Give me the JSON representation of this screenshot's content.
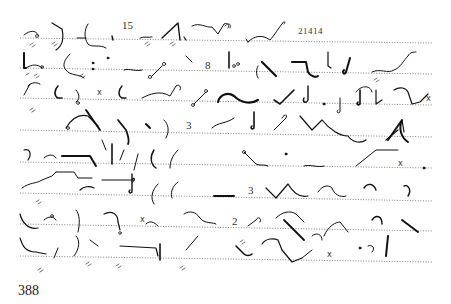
{
  "page": {
    "page_number": "388",
    "content_type": "shorthand-outlines",
    "line_count": 8
  },
  "numerals": [
    {
      "id": "n15",
      "text": "15",
      "x": 122,
      "y": 28
    },
    {
      "id": "n21414",
      "text": "21414",
      "x": 298,
      "y": 33
    },
    {
      "id": "n8",
      "text": "8",
      "x": 205,
      "y": 61
    },
    {
      "id": "n3a",
      "text": "3",
      "x": 186,
      "y": 121
    },
    {
      "id": "n3b",
      "text": "3",
      "x": 248,
      "y": 186
    },
    {
      "id": "n2",
      "text": "2",
      "x": 232,
      "y": 217
    }
  ],
  "markers": [
    {
      "id": "x1",
      "text": "x",
      "x": 97,
      "y": 90
    },
    {
      "id": "x2",
      "text": "x",
      "x": 426,
      "y": 97
    },
    {
      "id": "x3",
      "text": "x",
      "x": 398,
      "y": 161
    },
    {
      "id": "x4",
      "text": "x",
      "x": 140,
      "y": 217
    },
    {
      "id": "x5",
      "text": "x",
      "x": 327,
      "y": 252
    }
  ],
  "colors": {
    "ink": "#111111",
    "rule": "#555555",
    "paper": "#ffffff"
  }
}
